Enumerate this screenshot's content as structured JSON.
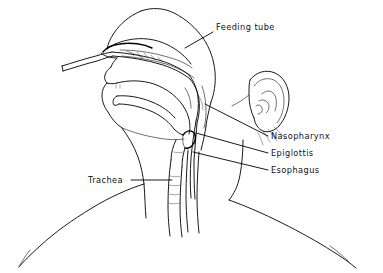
{
  "figure": {
    "kind": "anatomical-line-drawing",
    "background_color": "#ffffff",
    "ink_color": "#1a1a1a",
    "width": 383,
    "height": 273
  },
  "labels": [
    {
      "id": "feeding-tube",
      "text": "Feeding tube",
      "x": 216,
      "y": 30,
      "anchor": "start",
      "leader": "M 213 32 L 185 48"
    },
    {
      "id": "nasopharynx",
      "text": "Nasopharynx",
      "x": 271,
      "y": 139,
      "anchor": "start",
      "leader": "M 268 136 L 205 104"
    },
    {
      "id": "epiglottis",
      "text": "Epiglottis",
      "x": 271,
      "y": 156,
      "anchor": "start",
      "leader": "M 268 153 L 196 133"
    },
    {
      "id": "esophagus",
      "text": "Esophagus",
      "x": 271,
      "y": 173,
      "anchor": "start",
      "leader": "M 268 170 L 193 152"
    },
    {
      "id": "trachea",
      "text": "Trachea",
      "x": 88,
      "y": 183,
      "anchor": "start",
      "leader": "M 131 180 L 172 180"
    }
  ],
  "structures": {
    "head_profile": "forehead, nasal bridge, nose, lips, chin",
    "ear": "auricle with helix, antihelix, tragus, lobe",
    "airway": "nasal passage, nasopharynx, oropharynx, epiglottis, larynx, trachea",
    "digestive": "oral cavity, tongue, esophagus",
    "device": "nasogastric feeding tube entering nostril and descending through nasopharynx into esophagus",
    "body": "neck, shoulders"
  }
}
